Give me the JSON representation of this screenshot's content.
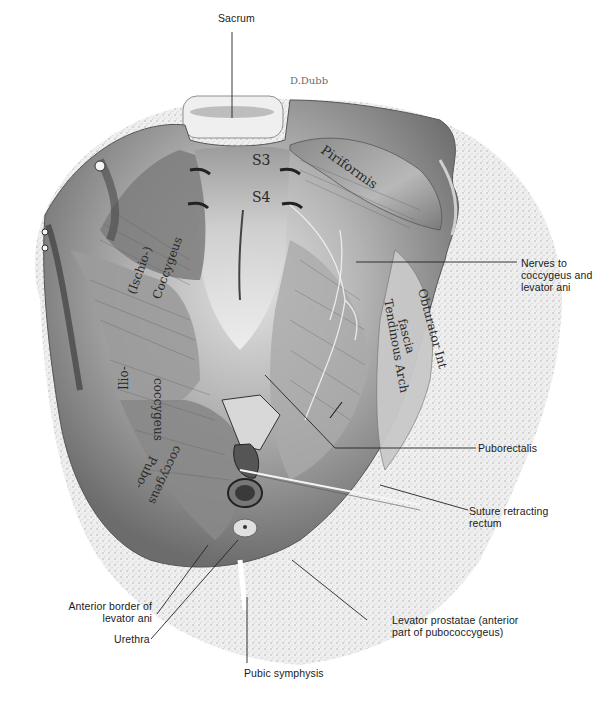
{
  "figure": {
    "palette": {
      "background": "#ffffff",
      "bone": "#ededed",
      "bone_stipple": "#9a9a9a",
      "muscle_dark": "#6e6e6e",
      "muscle_mid": "#a3a3a3",
      "muscle_light": "#d6d6d6",
      "fascia": "#e8e8e8",
      "leader_line": "#222222",
      "text": "#1a1a1a"
    }
  },
  "callouts": {
    "sacrum": "Sacrum",
    "nerves_line1": "Nerves to",
    "nerves_line2": "coccygeus and",
    "nerves_line3": "levator ani",
    "puborectalis": "Puborectalis",
    "suture_line1": "Suture retracting",
    "suture_line2": "rectum",
    "anterior_line1": "Anterior border of",
    "anterior_line2": "levator ani",
    "urethra": "Urethra",
    "levator_prostatae_line1": "Levator prostatae (anterior",
    "levator_prostatae_line2": "part of pubococcygeus)",
    "pubic_symphysis": "Pubic symphysis"
  },
  "in_figure_labels": {
    "s3": "S3",
    "s4": "S4",
    "piriformis": "Piriformis",
    "ischio": "(Ischio-)",
    "coccygeus": "Coccygeus",
    "ilio": "Ilio-",
    "iliococcygeus": "coccygeus",
    "pubo": "Pubo-",
    "pubococcygeus": "coccygeus",
    "obturator": "Obturator Int",
    "fascia": "fascia",
    "tendinous_arch": "Tendinous Arch",
    "signature": "D.Dubb"
  }
}
